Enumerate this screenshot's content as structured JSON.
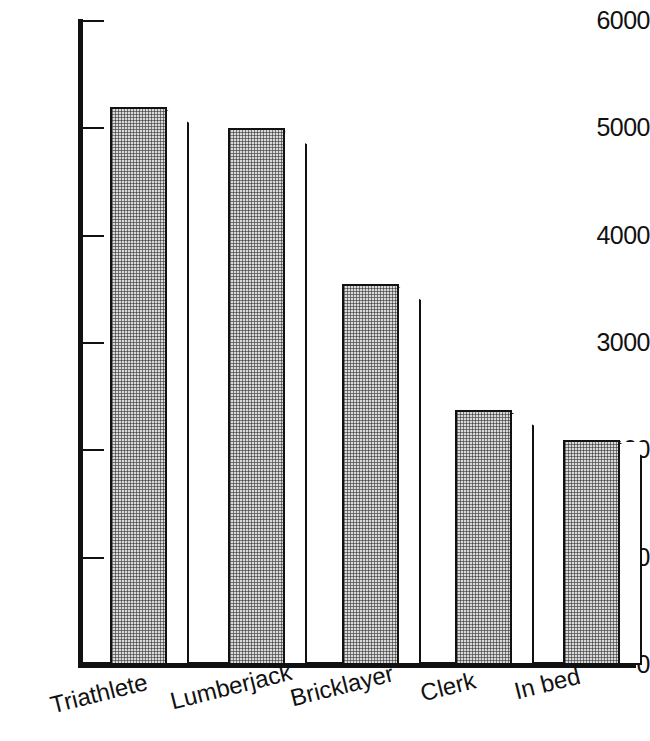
{
  "chart_data": {
    "type": "bar",
    "title": "",
    "subtitle": "",
    "xlabel": "",
    "ylabel": "",
    "categories": [
      "Triathlete",
      "Lumberjack",
      "Bricklayer",
      "Clerk",
      "In bed"
    ],
    "values": [
      5200,
      5000,
      3550,
      2380,
      2100
    ],
    "ylim": [
      0,
      6000
    ],
    "ytick_labels": [
      "6000",
      "5000",
      "4000",
      "3000",
      "2000",
      "1000",
      "0"
    ],
    "yticks": [
      6000,
      5000,
      4000,
      3000,
      2000,
      1000,
      0
    ],
    "grid": false,
    "legend": null,
    "legend_position": "none",
    "annotations": [],
    "style": {
      "bar_face_color": "#d9d9d9",
      "bar_edge_color": "#111111",
      "bar_side_color": "#ffffff",
      "axis_color": "#111111",
      "background": "#ffffff",
      "bar_fill_pattern": "fine-dotted",
      "three_d": true,
      "category_label_rotation_deg": -14
    }
  },
  "axes": {
    "y_axis_name": "y-axis",
    "x_axis_name": "x-axis"
  }
}
